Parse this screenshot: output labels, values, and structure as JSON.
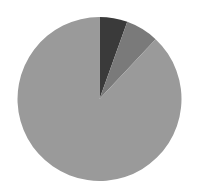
{
  "chart_data": {
    "type": "pie",
    "title": "",
    "start_angle_deg": 0,
    "direction": "clockwise",
    "center": [
      99.5,
      99
    ],
    "radius": 82,
    "slices": [
      {
        "label": "",
        "value": 5.5,
        "color": "#3a3a3a"
      },
      {
        "label": "",
        "value": 6.5,
        "color": "#7a7a7a"
      },
      {
        "label": "",
        "value": 88.0,
        "color": "#9a9a9a"
      }
    ],
    "legend": null,
    "data_labels": false
  }
}
